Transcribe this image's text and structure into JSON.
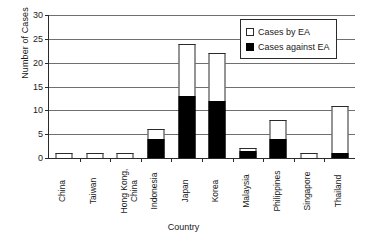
{
  "chart_data": {
    "type": "bar",
    "stacked": true,
    "title": "",
    "xlabel": "Country",
    "ylabel": "Number of Cases",
    "ylim": [
      0,
      30
    ],
    "ytick_step": 5,
    "yticks": [
      0,
      5,
      10,
      15,
      20,
      25,
      30
    ],
    "grid": true,
    "legend_position": "top-right",
    "categories": [
      "China",
      "Taiwan",
      "Hong Kong,\nChina",
      "Indonesia",
      "Japan",
      "Korea",
      "Malaysia",
      "Philippines",
      "Singapore",
      "Thailand"
    ],
    "series": [
      {
        "name": "Cases against EA",
        "color": "#000000",
        "values": [
          0,
          0,
          0,
          4,
          13,
          12,
          1.5,
          4,
          0,
          1
        ]
      },
      {
        "name": "Cases by EA",
        "color": "#ffffff",
        "values": [
          1,
          1,
          1,
          2,
          11,
          10,
          0.5,
          4,
          1,
          10
        ]
      }
    ],
    "totals": [
      1,
      1,
      1,
      6,
      24,
      22,
      2,
      8,
      1,
      11
    ]
  },
  "legend": {
    "items": [
      {
        "label": "Cases by EA",
        "swatch": "white"
      },
      {
        "label": "Cases against EA",
        "swatch": "black"
      }
    ]
  },
  "axes": {
    "y_title": "Number of Cases",
    "x_title": "Country"
  }
}
